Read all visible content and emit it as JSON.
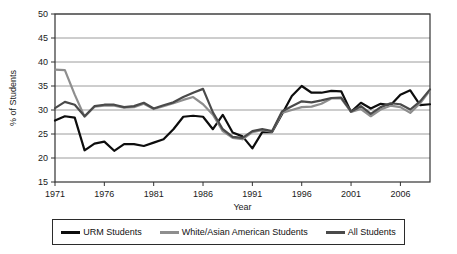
{
  "chart_data": {
    "type": "line",
    "title": "",
    "xlabel": "Year",
    "ylabel": "% of Students",
    "xlim": [
      1971,
      2009
    ],
    "ylim": [
      15,
      50
    ],
    "ytick_step": 5,
    "grid": true,
    "grid_axis": "y",
    "legend_position": "bottom",
    "x": [
      1971,
      1972,
      1973,
      1974,
      1975,
      1976,
      1977,
      1978,
      1979,
      1980,
      1981,
      1982,
      1983,
      1984,
      1985,
      1986,
      1987,
      1988,
      1989,
      1990,
      1991,
      1992,
      1993,
      1994,
      1995,
      1996,
      1997,
      1998,
      1999,
      2000,
      2001,
      2002,
      2003,
      2004,
      2005,
      2006,
      2007,
      2008,
      2009
    ],
    "xticks": [
      1971,
      1976,
      1981,
      1986,
      1991,
      1996,
      2001,
      2006
    ],
    "yticks": [
      15,
      20,
      25,
      30,
      35,
      40,
      45,
      50
    ],
    "series": [
      {
        "name": "URM Students",
        "color": "#0d0d0d",
        "width": 2.2,
        "values": [
          27.8,
          28.7,
          28.4,
          21.6,
          23.0,
          23.4,
          21.5,
          22.9,
          22.9,
          22.5,
          23.2,
          23.9,
          26.0,
          28.6,
          28.8,
          28.6,
          26.0,
          29.0,
          25.3,
          24.5,
          22.0,
          25.4,
          25.4,
          29.1,
          32.9,
          35.0,
          33.6,
          33.6,
          34.0,
          33.9,
          29.6,
          31.5,
          30.3,
          31.3,
          31.0,
          33.2,
          34.1,
          31.0,
          31.2
        ]
      },
      {
        "name": "White/Asian American Students",
        "color": "#8e8e8e",
        "width": 2.2,
        "values": [
          38.4,
          38.3,
          33.2,
          28.6,
          30.7,
          30.9,
          30.9,
          30.5,
          30.6,
          31.3,
          30.2,
          30.8,
          31.4,
          32.1,
          32.7,
          31.2,
          29.0,
          25.6,
          24.2,
          23.9,
          25.4,
          25.8,
          25.5,
          29.4,
          30.0,
          30.6,
          30.7,
          31.3,
          32.4,
          32.4,
          29.6,
          30.2,
          28.7,
          30.1,
          30.9,
          30.6,
          29.4,
          31.4,
          34.1
        ]
      },
      {
        "name": "All Students",
        "color": "#4a4a4a",
        "width": 2.2,
        "values": [
          30.4,
          31.7,
          31.1,
          28.7,
          30.8,
          31.1,
          31.1,
          30.6,
          30.8,
          31.5,
          30.3,
          31.0,
          31.6,
          32.7,
          33.6,
          34.4,
          29.5,
          26.0,
          24.4,
          24.2,
          25.6,
          26.0,
          25.6,
          29.7,
          30.8,
          31.8,
          31.6,
          32.0,
          32.5,
          32.6,
          29.7,
          30.8,
          29.2,
          30.6,
          31.4,
          31.2,
          30.1,
          31.8,
          34.3
        ]
      }
    ]
  },
  "axes": {
    "y_tick_labels": [
      "50",
      "45",
      "40",
      "35",
      "30",
      "25",
      "20",
      "15"
    ],
    "x_tick_labels": [
      "1971",
      "1976",
      "1981",
      "1986",
      "1991",
      "1996",
      "2001",
      "2006"
    ],
    "y_axis_title": "% of Students",
    "x_axis_title": "Year"
  },
  "legend": {
    "entries": [
      {
        "label": "URM Students",
        "color": "#0d0d0d"
      },
      {
        "label": "White/Asian American Students",
        "color": "#8e8e8e"
      },
      {
        "label": "All Students",
        "color": "#4a4a4a"
      }
    ]
  },
  "style": {
    "background": "#ffffff",
    "gridline_color": "#9c9c9c",
    "frame_color": "#333333"
  }
}
